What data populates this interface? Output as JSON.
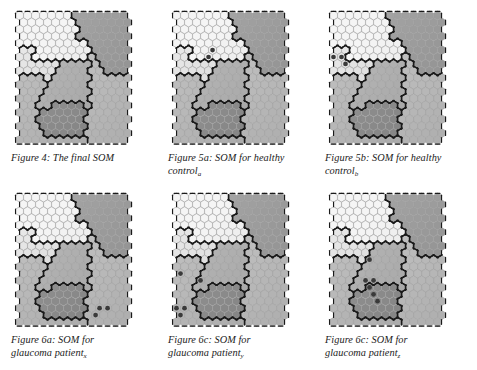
{
  "document": {
    "kind": "figure-panel",
    "title": "Self-Organizing Map figures",
    "background_color": "#ffffff",
    "text_color": "#1b1b1b"
  },
  "palette": {
    "region_lightest": "#ececec",
    "region_light": "#dcdcdc",
    "region_mid_light": "#cfcfcf",
    "region_mid": "#bdbdbd",
    "region_mid_dark": "#aeaeae",
    "region_dark": "#9a9a9a",
    "region_darkest": "#8d8d8d",
    "cell_outline": "#9c9c9c",
    "boundary_line": "#1a1a1a",
    "marker_fill": "#3a3a3a"
  },
  "figures": [
    {
      "id": "figure-4",
      "position": "top-left",
      "caption_lines": [
        "Figure 4: The final SOM"
      ],
      "caption_subscript": "",
      "markers": []
    },
    {
      "id": "figure-5a",
      "position": "top-middle",
      "caption_lines": [
        "Figure 5a: SOM for healthy",
        "control"
      ],
      "caption_subscript": "a",
      "markers": [
        {
          "col": 4,
          "row": 5
        },
        {
          "col": 4,
          "row": 6
        }
      ]
    },
    {
      "id": "figure-5b",
      "position": "top-right",
      "caption_lines": [
        "Figure 5b: SOM for healthy",
        "control"
      ],
      "caption_subscript": "b",
      "markers": [
        {
          "col": 0,
          "row": 6
        },
        {
          "col": 1,
          "row": 6
        },
        {
          "col": 1,
          "row": 7
        }
      ]
    },
    {
      "id": "figure-6a",
      "position": "bottom-left",
      "caption_lines": [
        "Figure 6a: SOM for",
        "glaucoma patient"
      ],
      "caption_subscript": "x",
      "markers": [
        {
          "col": 10,
          "row": 16
        },
        {
          "col": 11,
          "row": 16
        },
        {
          "col": 9,
          "row": 17
        }
      ]
    },
    {
      "id": "figure-6c-middle",
      "position": "bottom-middle",
      "caption_lines": [
        "Figure 6c: SOM for",
        "glaucoma patient"
      ],
      "caption_subscript": "y",
      "markers": [
        {
          "col": 0,
          "row": 11
        },
        {
          "col": 3,
          "row": 12
        },
        {
          "col": 0,
          "row": 16
        },
        {
          "col": 1,
          "row": 16
        },
        {
          "col": 0,
          "row": 17
        }
      ]
    },
    {
      "id": "figure-6c-right",
      "position": "bottom-right",
      "caption_lines": [
        "Figure 6c: SOM for",
        "glaucoma patient"
      ],
      "caption_subscript": "z",
      "markers": [
        {
          "col": 4,
          "row": 9
        },
        {
          "col": 4,
          "row": 12
        },
        {
          "col": 5,
          "row": 12
        },
        {
          "col": 4,
          "row": 13
        },
        {
          "col": 5,
          "row": 14
        },
        {
          "col": 5,
          "row": 15
        }
      ]
    }
  ],
  "map_spec": {
    "columns": 14,
    "rows": 19,
    "cell_shape": "hexagon",
    "regions": [
      {
        "name": "upper-left-lightest",
        "shade": "#ececec"
      },
      {
        "name": "left-light",
        "shade": "#dcdcdc"
      },
      {
        "name": "upper-right-dark",
        "shade": "#9a9a9a"
      },
      {
        "name": "right-mid",
        "shade": "#bdbdbd"
      },
      {
        "name": "center-mid-dark",
        "shade": "#aeaeae"
      },
      {
        "name": "lower-left-mid",
        "shade": "#b5b5b5"
      },
      {
        "name": "lower-center-darkest",
        "shade": "#8d8d8d"
      }
    ]
  }
}
